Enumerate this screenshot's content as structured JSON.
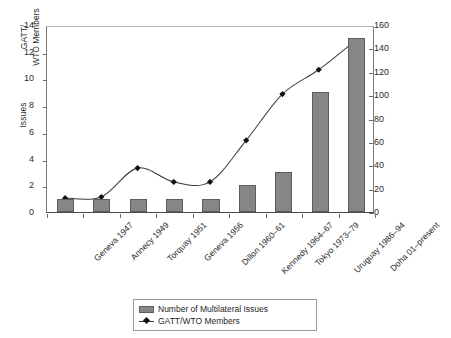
{
  "chart_data": {
    "type": "bar",
    "title": "",
    "subtitle": "",
    "xlabel": "",
    "ylabel": "Issues",
    "y2label": "GATT/ WTO Members",
    "grid": false,
    "legend_position": "bottom",
    "categories": [
      "Geneva 1947",
      "Annecy 1949",
      "Torquay 1951",
      "Geneva 1956",
      "Dillon 1960–61",
      "Kennedy 1964–67",
      "Tokyo 1973–79",
      "Uruguay 1986–94",
      "Doha 01–present"
    ],
    "ylim": [
      0,
      14
    ],
    "yticks": [
      0,
      2,
      4,
      6,
      8,
      10,
      12,
      14
    ],
    "y2lim": [
      0,
      160
    ],
    "y2ticks": [
      0,
      20,
      40,
      60,
      80,
      100,
      120,
      140,
      160
    ],
    "series": [
      {
        "name": "Number of Multilateral Issues",
        "type": "bar",
        "axis": "left",
        "color": "#868686",
        "values": [
          1,
          1,
          1,
          1,
          1,
          2,
          3,
          9,
          13
        ]
      },
      {
        "name": "GATT/WTO Members",
        "type": "line",
        "axis": "right",
        "color": "#3a3a3a",
        "marker": "diamond",
        "values": [
          12,
          13,
          38,
          26,
          26,
          62,
          102,
          123,
          148
        ]
      }
    ]
  },
  "axes": {
    "left_title": "Issues",
    "right_title_line1": "GATT/",
    "right_title_line2": "WTO Members",
    "left_tick_labels": [
      "14",
      "12",
      "10",
      "8",
      "6",
      "4",
      "2",
      "0"
    ],
    "right_tick_labels": [
      "160",
      "140",
      "120",
      "100",
      "80",
      "60",
      "40",
      "20",
      "0"
    ]
  },
  "legend": {
    "items": [
      {
        "label": "Number of Multilateral Issues",
        "marker": "bar-swatch"
      },
      {
        "label": "GATT/WTO Members",
        "marker": "line-diamond-swatch"
      }
    ]
  }
}
